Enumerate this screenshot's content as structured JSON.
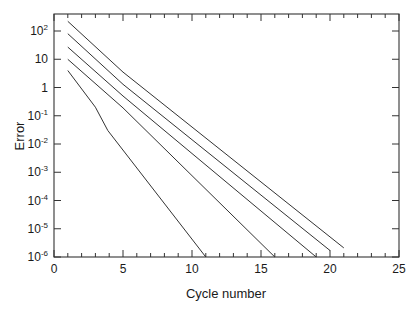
{
  "chart_data": {
    "type": "line",
    "title": "",
    "xlabel": "Cycle number",
    "ylabel": "Error",
    "xscale": "linear",
    "yscale": "log",
    "xlim": [
      0,
      25
    ],
    "ylim": [
      1e-06,
      300
    ],
    "xticks": [
      0,
      5,
      10,
      15,
      20,
      25
    ],
    "xtick_labels": [
      "0",
      "5",
      "10",
      "15",
      "20",
      "25"
    ],
    "yticks": [
      100,
      10,
      1,
      0.1,
      0.01,
      0.001,
      0.0001,
      1e-05,
      1e-06
    ],
    "ytick_labels": [
      {
        "base": "10",
        "exp": "2"
      },
      {
        "base": "10",
        "exp": ""
      },
      {
        "base": "1",
        "exp": ""
      },
      {
        "base": "10",
        "exp": "-1"
      },
      {
        "base": "10",
        "exp": "-2"
      },
      {
        "base": "10",
        "exp": "-3"
      },
      {
        "base": "10",
        "exp": "-4"
      },
      {
        "base": "10",
        "exp": "-5"
      },
      {
        "base": "10",
        "exp": "-6"
      }
    ],
    "grid": false,
    "legend": null,
    "series": [
      {
        "name": "curve 1",
        "x": [
          1,
          5,
          21
        ],
        "y": [
          220,
          3.5,
          2.1e-06
        ]
      },
      {
        "name": "curve 2",
        "x": [
          1,
          5,
          20
        ],
        "y": [
          80,
          1.3,
          1.7e-06
        ]
      },
      {
        "name": "curve 3",
        "x": [
          1,
          5,
          19
        ],
        "y": [
          27,
          0.5,
          1e-06
        ]
      },
      {
        "name": "curve 4",
        "x": [
          1,
          5,
          16
        ],
        "y": [
          10,
          0.19,
          1e-06
        ]
      },
      {
        "name": "curve 5",
        "x": [
          1,
          3,
          3.9,
          11
        ],
        "y": [
          4,
          0.2,
          0.03,
          1e-06
        ]
      }
    ],
    "line_color": "#333333"
  }
}
